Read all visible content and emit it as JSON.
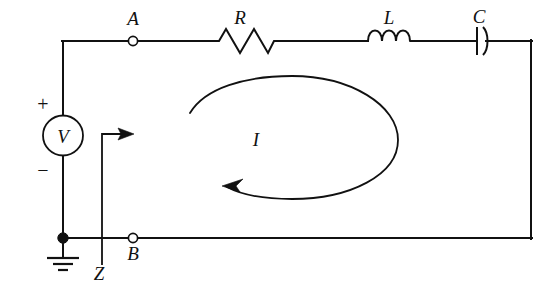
{
  "figure": {
    "type": "circuit-schematic",
    "background_color": "#ffffff",
    "line_color": "#111111"
  },
  "labels": {
    "terminal_a": "A",
    "terminal_b": "B",
    "resistor": "R",
    "inductor": "L",
    "capacitor": "C",
    "source": "V",
    "current": "I",
    "impedance": "Z",
    "polarity_plus": "+",
    "polarity_minus": "−"
  },
  "components": [
    {
      "name": "voltage-source",
      "symbol": "circle-V",
      "label": "V"
    },
    {
      "name": "resistor",
      "symbol": "zigzag",
      "label": "R"
    },
    {
      "name": "inductor",
      "symbol": "coil-3-loops",
      "label": "L"
    },
    {
      "name": "capacitor",
      "symbol": "plate-and-curve",
      "label": "C"
    },
    {
      "name": "ground",
      "symbol": "earth-3-bars",
      "label": ""
    }
  ],
  "terminals": [
    {
      "name": "terminal-a",
      "label": "A",
      "style": "open-circle"
    },
    {
      "name": "terminal-b",
      "label": "B",
      "style": "open-circle"
    }
  ],
  "annotations": [
    {
      "name": "current-loop",
      "label": "I",
      "direction": "counterclockwise",
      "style": "open-ellipse-with-arrowhead"
    },
    {
      "name": "impedance-marker",
      "label": "Z",
      "style": "bracket-arrow-right"
    }
  ]
}
